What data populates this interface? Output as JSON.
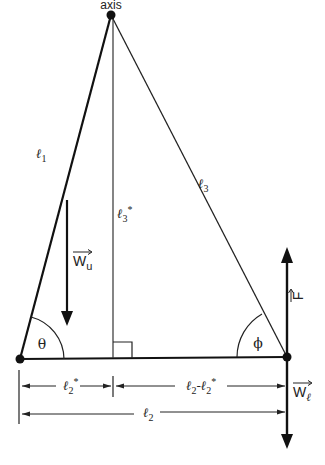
{
  "figure": {
    "axis_label": "axis",
    "sides": {
      "l1": {
        "base": "ℓ",
        "sub": "1"
      },
      "l3": {
        "base": "ℓ",
        "sub": "3"
      },
      "l3_star": {
        "base": "ℓ",
        "sub": "3",
        "sup": "*"
      }
    },
    "angles": {
      "theta": "θ",
      "phi": "ϕ"
    },
    "forces": {
      "W_u": {
        "base": "W",
        "sub": "u",
        "direction": "down"
      },
      "F": {
        "base": "F",
        "direction": "up"
      },
      "W_l": {
        "base": "W",
        "sub": "ℓ",
        "direction": "down"
      }
    },
    "dimensions": {
      "l2_star": {
        "base": "ℓ",
        "sub": "2",
        "sup": "*"
      },
      "l2_minus_l2_star": {
        "a": "ℓ",
        "a_sub": "2",
        "op": "-",
        "b": "ℓ",
        "b_sub": "2",
        "b_sup": "*"
      },
      "l2": {
        "base": "ℓ",
        "sub": "2"
      }
    },
    "colors": {
      "line": "#111111",
      "thin_line": "#333333",
      "background": "#ffffff"
    }
  }
}
